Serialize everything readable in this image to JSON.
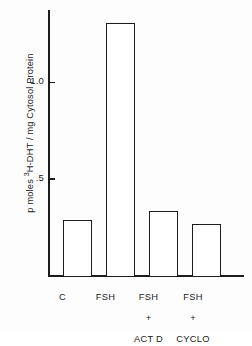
{
  "chart_data": {
    "type": "bar",
    "title": "",
    "subtitle": "",
    "xlabel": "",
    "ylabel": "p moles 3H-DHT / mg Cytosol Protein",
    "ylabel_parts": {
      "before_sup": "p moles ",
      "sup": "3",
      "after_sup": "H-DHT / mg Cytosol Protein"
    },
    "categories": [
      "C",
      "FSH",
      "FSH\n+\nACT D",
      "FSH\n+\nCYCLO"
    ],
    "category_labels": [
      {
        "line1": "C",
        "line2": "",
        "line3": ""
      },
      {
        "line1": "FSH",
        "line2": "",
        "line3": ""
      },
      {
        "line1": "FSH",
        "line2": "+",
        "line3": "ACT D"
      },
      {
        "line1": "FSH",
        "line2": "+",
        "line3": "CYCLO"
      }
    ],
    "values": [
      0.29,
      1.31,
      0.34,
      0.27
    ],
    "ylim": [
      0,
      1.37
    ],
    "yticks": [
      0.5,
      1.0
    ],
    "ytick_labels": [
      ".5",
      "1.0"
    ],
    "grid": false,
    "legend": null,
    "bar_fill": "#ffffff",
    "bar_edge": "#1c1c1c",
    "axis_color": "#1c1c1c",
    "background": "#fdfdfd"
  }
}
